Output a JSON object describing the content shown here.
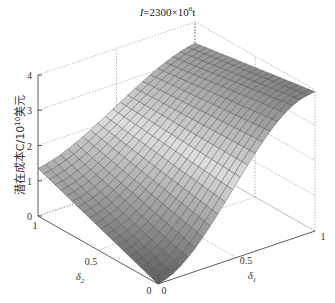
{
  "chart_data": {
    "type": "surface3d",
    "title_parts": {
      "var": "I",
      "rest": "=2300×10",
      "sup": "6",
      "unit": "t"
    },
    "xlabel": "δ1",
    "ylabel": "δ2",
    "zlabel": "潜在成本C/10^10美元",
    "zlabel_parts": {
      "main": "潜在成本C/10",
      "sup": "10",
      "tail": "美元"
    },
    "xlim": [
      0,
      1
    ],
    "ylim": [
      0,
      1
    ],
    "zlim": [
      0,
      4
    ],
    "x_ticks": [
      "0",
      "0.5",
      "1"
    ],
    "y_ticks": [
      "0",
      "0.5",
      "1"
    ],
    "z_ticks": [
      "0",
      "1",
      "2",
      "3",
      "4"
    ],
    "grid": true,
    "colormap": "gray",
    "corner_values": {
      "d1_0_d2_0": 0.0,
      "d1_0_d2_1": 1.35,
      "d1_1_d2_0": 3.95,
      "d1_1_d2_1": 3.4
    },
    "grid_resolution": 21
  }
}
